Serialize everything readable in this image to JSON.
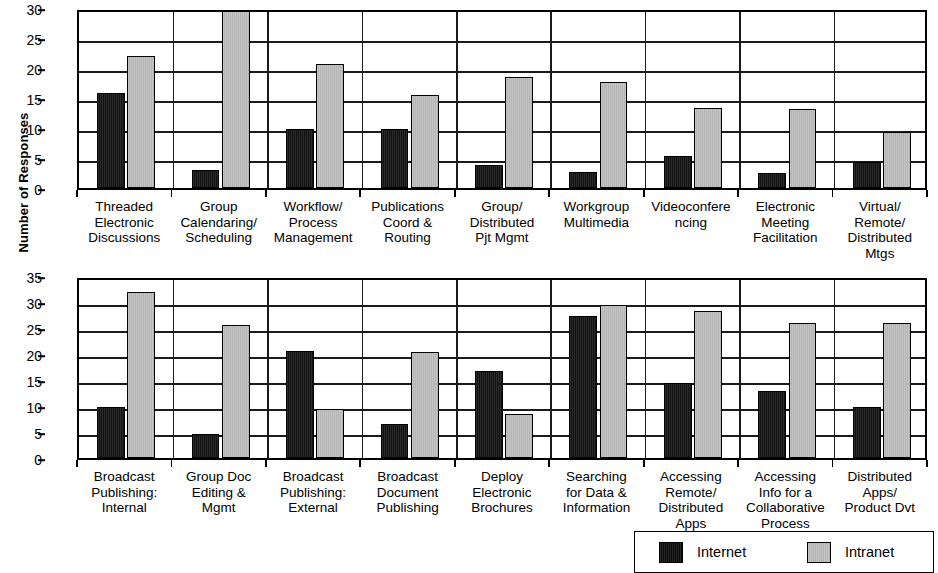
{
  "figure": {
    "y_axis_title": "Number of Responses"
  },
  "legend": {
    "position": "bottom-right",
    "entries": [
      {
        "label": "Internet",
        "color": "#1c1c1c",
        "icon": "legend-swatch-black"
      },
      {
        "label": "Intranet",
        "color": "#bdbdbd",
        "icon": "legend-swatch-gray"
      }
    ]
  },
  "chart_data": [
    {
      "type": "bar",
      "title": "",
      "xlabel": "",
      "ylabel": "Number of Responses",
      "ylim": [
        0,
        30
      ],
      "yticks": [
        0,
        5,
        10,
        15,
        20,
        25,
        30
      ],
      "grid": true,
      "legend_position": "bottom-right",
      "categories": [
        "Threaded\nElectronic\nDiscussions",
        "Group\nCalendaring/\nScheduling",
        "Workflow/\nProcess\nManagement",
        "Publications\nCoord &\nRouting",
        "Group/\nDistributed\nPjt Mgmt",
        "Workgroup\nMultimedia",
        "Videoconfere\nncing",
        "Electronic\nMeeting\nFacilitation",
        "Virtual/\nRemote/\nDistributed\nMtgs"
      ],
      "series": [
        {
          "name": "Internet",
          "color": "#1c1c1c",
          "values": [
            15.8,
            3.0,
            9.9,
            9.8,
            3.9,
            2.6,
            5.4,
            2.5,
            4.4
          ]
        },
        {
          "name": "Intranet",
          "color": "#bdbdbd",
          "values": [
            22.0,
            30.0,
            20.6,
            15.5,
            18.5,
            17.6,
            13.3,
            13.2,
            9.3
          ]
        }
      ]
    },
    {
      "type": "bar",
      "title": "",
      "xlabel": "",
      "ylabel": "Number of Responses",
      "ylim": [
        0,
        35
      ],
      "yticks": [
        0,
        5,
        10,
        15,
        20,
        25,
        30,
        35
      ],
      "grid": true,
      "legend_position": "bottom-right",
      "categories": [
        "Broadcast\nPublishing:\nInternal",
        "Group Doc\nEditing &\nMgmt",
        "Broadcast\nPublishing:\nExternal",
        "Broadcast\nDocument\nPublishing",
        "Deploy\nElectronic\nBrochures",
        "Searching\nfor Data &\nInformation",
        "Accessing\nRemote/\nDistributed\nApps",
        "Accessing\nInfo for a\nCollaborative\nProcess",
        "Distributed\nApps/\nProduct Dvt"
      ],
      "series": [
        {
          "name": "Internet",
          "color": "#1c1c1c",
          "values": [
            9.8,
            4.7,
            20.5,
            6.5,
            16.7,
            27.3,
            14.5,
            12.8,
            9.8
          ]
        },
        {
          "name": "Intranet",
          "color": "#bdbdbd",
          "values": [
            32.0,
            25.5,
            9.5,
            20.4,
            8.4,
            29.5,
            28.3,
            26.0,
            26.0
          ]
        }
      ]
    }
  ]
}
